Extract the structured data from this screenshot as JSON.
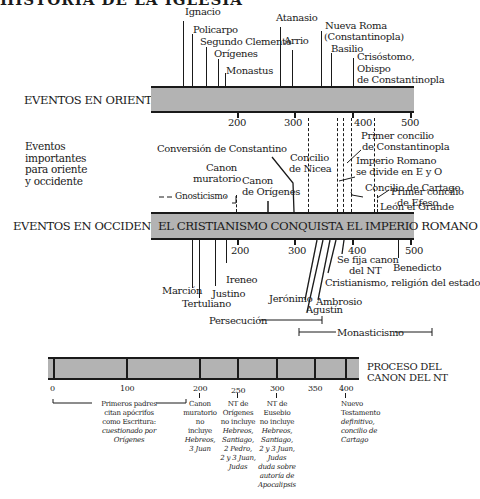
{
  "title": "HISTORIA DE LA IGLESIA",
  "oriente": {
    "section_label": "EVENTOS EN ORIENTE",
    "ticks": [
      "200",
      "300",
      "400",
      "500"
    ],
    "events": [
      {
        "label": "Ignacio"
      },
      {
        "label": "Policarpo"
      },
      {
        "label": "Segundo Clemente"
      },
      {
        "label": "Orígenes"
      },
      {
        "label": "Monastus"
      },
      {
        "label": "Atanasio"
      },
      {
        "label": "Arrio"
      },
      {
        "label": "Nueva Roma"
      },
      {
        "label": "(Constantinopla)"
      },
      {
        "label": "Basilio"
      },
      {
        "label": "Crisóstomo,"
      },
      {
        "label": "Obispo"
      },
      {
        "label": "de Constantinopla"
      }
    ]
  },
  "comunes": {
    "section_label_lines": [
      "Eventos",
      "importantes",
      "para oriente",
      "y occidente"
    ],
    "events": [
      {
        "label": "Conversión de Constantino"
      },
      {
        "label": "Canon"
      },
      {
        "label": "muratorio"
      },
      {
        "label": "Canon"
      },
      {
        "label": "de Orígenes"
      },
      {
        "label": "Gnosticismo"
      },
      {
        "label": "Concilio"
      },
      {
        "label": "de Nicea"
      },
      {
        "label": "Primer concilio"
      },
      {
        "label": "de Constantinopla"
      },
      {
        "label": "Imperio Romano"
      },
      {
        "label": "se divide en E y O"
      },
      {
        "label": "Concilio de Cartago"
      },
      {
        "label": "Primer concilio"
      },
      {
        "label": "de Efeso"
      },
      {
        "label": "León el Grande"
      }
    ]
  },
  "occidente": {
    "section_label": "EVENTOS EN OCCIDENTE",
    "bar_text": "EL CRISTIANISMO CONQUISTA EL IMPERIO ROMANO",
    "ticks": [
      "200",
      "300",
      "400",
      "500"
    ],
    "events": [
      {
        "label": "Marción"
      },
      {
        "label": "Tertuliano"
      },
      {
        "label": "Justino"
      },
      {
        "label": "Ireneo"
      },
      {
        "label": "Jerónimo"
      },
      {
        "label": "Agustín"
      },
      {
        "label": "Ambrosio"
      },
      {
        "label": "Se fija canon"
      },
      {
        "label": "del NT"
      },
      {
        "label": "Cristianismo, religión del estado"
      },
      {
        "label": "Benedicto"
      }
    ],
    "periods": [
      {
        "label": "Persecución"
      },
      {
        "label": "Monasticismo"
      }
    ]
  },
  "canon": {
    "section_label_lines": [
      "PROCESO DEL",
      "CANON DEL NT"
    ],
    "ticks": [
      "0",
      "100",
      "200",
      "250",
      "300",
      "350",
      "400"
    ],
    "notes": [
      {
        "lines": [
          "Primeros padres",
          "citan apócrifos",
          "como Escritura:"
        ],
        "italic_lines": [
          "cuestionado por",
          "Orígenes"
        ]
      },
      {
        "lines": [
          "Canon",
          "muratorio",
          "no",
          "incluye"
        ],
        "italic_lines": [
          "Hebreos,",
          "3 Juan"
        ]
      },
      {
        "lines": [
          "NT de",
          "Orígenes",
          "no incluye"
        ],
        "italic_lines": [
          "Hebreos,",
          "Santiago,",
          "2 Pedro,",
          "2 y 3 Juan,",
          "Judas"
        ]
      },
      {
        "lines": [
          "NT de",
          "Eusebio",
          "no incluye"
        ],
        "italic_lines": [
          "Hebreos,",
          "Santiago,",
          "2 y 3 Juan,",
          "Judas",
          "duda sobre",
          "autoría de",
          "Apocalipsis"
        ]
      },
      {
        "lines": [
          "Nuevo",
          "Testamento"
        ],
        "italic_lines": [
          "definitivo,",
          "concilio de",
          "Cartago"
        ]
      }
    ]
  },
  "colors": {
    "bar_fill": "#b3b3b3",
    "ink": "#1a1a1a",
    "background": "#ffffff"
  }
}
